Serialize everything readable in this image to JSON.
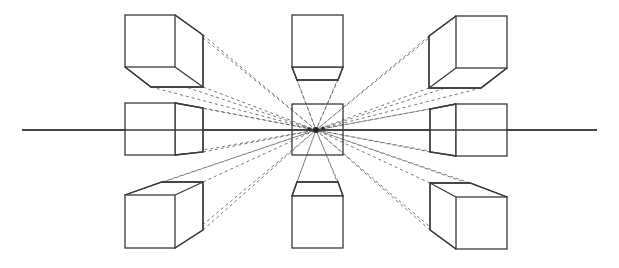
{
  "diagram": {
    "title": "",
    "type": "one-point perspective construction",
    "colors": {
      "line": "#3a3a3a",
      "dash": "#555555",
      "background": "#ffffff"
    },
    "horizon": {
      "x1": 22,
      "y": 130,
      "x2": 597
    },
    "vanishing_point": {
      "x": 316,
      "y": 130,
      "r": 3
    },
    "side_points": [
      {
        "x": 309,
        "y": 129,
        "r": 1.6
      },
      {
        "x": 323,
        "y": 128,
        "r": 1.6
      }
    ],
    "center_frame": {
      "x": 292,
      "y": 104,
      "w": 51,
      "h": 51
    },
    "cubes": [
      {
        "id": "top-left",
        "front": [
          125,
          15,
          175,
          67
        ],
        "back": [
          [
            175,
            15
          ],
          [
            203,
            35
          ],
          [
            203,
            87
          ],
          [
            151,
            87
          ],
          [
            125,
            67
          ]
        ]
      },
      {
        "id": "top-middle",
        "front": [
          292,
          15,
          343,
          67
        ],
        "back": [
          [
            292,
            67
          ],
          [
            297,
            80
          ],
          [
            338,
            80
          ],
          [
            343,
            67
          ]
        ]
      },
      {
        "id": "top-right",
        "front": [
          456,
          16,
          507,
          68
        ],
        "back": [
          [
            456,
            16
          ],
          [
            429,
            36
          ],
          [
            429,
            88
          ],
          [
            481,
            88
          ],
          [
            507,
            68
          ]
        ]
      },
      {
        "id": "middle-left",
        "front": [
          125,
          103,
          175,
          155
        ],
        "back": [
          [
            175,
            103
          ],
          [
            203,
            108
          ],
          [
            203,
            152
          ],
          [
            175,
            155
          ]
        ]
      },
      {
        "id": "middle-right",
        "front": [
          456,
          104,
          507,
          156
        ],
        "back": [
          [
            456,
            104
          ],
          [
            430,
            109
          ],
          [
            430,
            152
          ],
          [
            456,
            156
          ]
        ]
      },
      {
        "id": "bottom-left",
        "front": [
          125,
          195,
          175,
          248
        ],
        "back": [
          [
            125,
            195
          ],
          [
            162,
            182
          ],
          [
            203,
            182
          ],
          [
            203,
            230
          ],
          [
            175,
            248
          ]
        ]
      },
      {
        "id": "bottom-middle",
        "front": [
          292,
          196,
          343,
          248
        ],
        "back": [
          [
            292,
            196
          ],
          [
            297,
            182
          ],
          [
            338,
            182
          ],
          [
            343,
            196
          ]
        ]
      },
      {
        "id": "bottom-right",
        "front": [
          456,
          197,
          507,
          249
        ],
        "back": [
          [
            456,
            249
          ],
          [
            430,
            230
          ],
          [
            430,
            183
          ],
          [
            470,
            183
          ],
          [
            507,
            197
          ]
        ]
      }
    ]
  }
}
